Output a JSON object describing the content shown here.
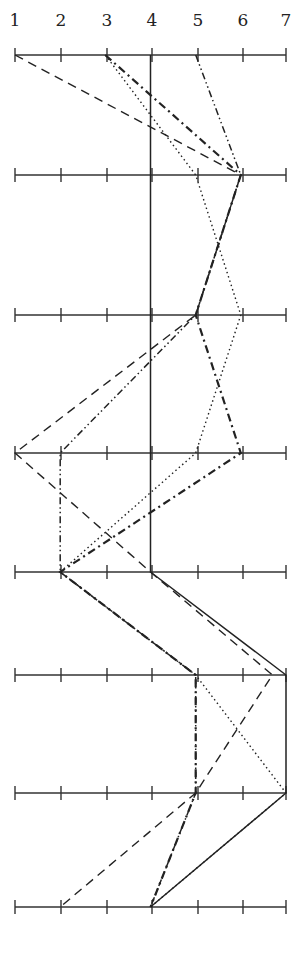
{
  "chart_data": {
    "type": "line",
    "title": "",
    "xlabel": "",
    "ylabel": "",
    "scale_ticks": [
      1,
      2,
      3,
      4,
      5,
      6,
      7
    ],
    "axes_count": 8,
    "orientation": "horizontal scales stacked vertically (profile / parallel-coordinate plot)",
    "xlim": [
      1,
      7
    ],
    "grid": false,
    "legend": null,
    "series": [
      {
        "name": "solid",
        "style": "solid",
        "values": [
          4,
          4,
          4,
          4,
          4,
          7,
          7,
          4
        ]
      },
      {
        "name": "long-dash",
        "style": "long-dash",
        "values": [
          1,
          6,
          5,
          1,
          4,
          6.7,
          5,
          2
        ]
      },
      {
        "name": "dotted",
        "style": "dotted",
        "values": [
          3,
          5,
          6,
          5,
          2,
          5,
          7,
          4
        ]
      },
      {
        "name": "heavy-dash-dot",
        "style": "heavy-dash-dot",
        "values": [
          3,
          6,
          5,
          6,
          2,
          5,
          5,
          4
        ]
      },
      {
        "name": "dash-dot-dot",
        "style": "dash-dot-dot",
        "values": [
          5,
          6,
          5,
          2,
          2,
          5,
          5,
          4
        ]
      }
    ]
  },
  "layout": {
    "x_positions": [
      15,
      61,
      107,
      152,
      198,
      243,
      286
    ],
    "axis_y": [
      55,
      175,
      315,
      453,
      572,
      675,
      793,
      907
    ],
    "label_y": 26
  }
}
